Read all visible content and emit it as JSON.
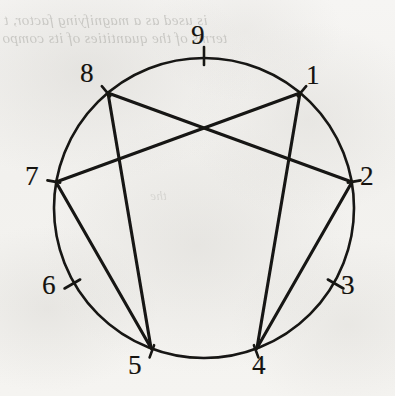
{
  "figure": {
    "kind": "circle-chord-diagram",
    "caption": "",
    "ink_color": "#171512",
    "paper_color": "#f4f3f1",
    "circle": {
      "cx": 204,
      "cy": 208,
      "r": 150
    },
    "nodes": [
      {
        "id": "1",
        "label": "1",
        "angle_deg": -50,
        "x": 300,
        "y": 93,
        "label_x": 306,
        "label_y": 62,
        "has_chords": true
      },
      {
        "id": "2",
        "label": "2",
        "angle_deg": -10,
        "x": 352,
        "y": 182,
        "label_x": 360,
        "label_y": 163,
        "has_chords": true
      },
      {
        "id": "3",
        "label": "3",
        "angle_deg": 30,
        "x": 334,
        "y": 283,
        "label_x": 341,
        "label_y": 272,
        "has_chords": false
      },
      {
        "id": "4",
        "label": "4",
        "angle_deg": 70,
        "x": 257,
        "y": 348,
        "label_x": 252,
        "label_y": 352,
        "has_chords": true
      },
      {
        "id": "5",
        "label": "5",
        "angle_deg": 110,
        "x": 151,
        "y": 348,
        "label_x": 128,
        "label_y": 352,
        "has_chords": true
      },
      {
        "id": "6",
        "label": "6",
        "angle_deg": 150,
        "x": 74,
        "y": 283,
        "label_x": 42,
        "label_y": 272,
        "has_chords": false
      },
      {
        "id": "7",
        "label": "7",
        "angle_deg": 190,
        "x": 56,
        "y": 182,
        "label_x": 25,
        "label_y": 163,
        "has_chords": true
      },
      {
        "id": "8",
        "label": "8",
        "angle_deg": 230,
        "x": 108,
        "y": 93,
        "label_x": 80,
        "label_y": 60,
        "has_chords": true
      },
      {
        "id": "9",
        "label": "9",
        "angle_deg": 270,
        "x": 204,
        "y": 58,
        "label_x": 191,
        "label_y": 22,
        "has_chords": false
      }
    ],
    "chords": [
      {
        "from": "8",
        "to": "2"
      },
      {
        "from": "1",
        "to": "7"
      },
      {
        "from": "1",
        "to": "4"
      },
      {
        "from": "2",
        "to": "4"
      },
      {
        "from": "8",
        "to": "5"
      },
      {
        "from": "7",
        "to": "5"
      }
    ],
    "showthrough_text": {
      "line1": "is used as a magnifying factor, t",
      "line2": "terms of the quantities of its compo",
      "line3": "the",
      "line4": ""
    }
  },
  "chart_data": {
    "type": "scatter",
    "title": "",
    "subtitle": "",
    "xlabel": "",
    "ylabel": "",
    "grid": false,
    "legend": null,
    "categories": [
      "1",
      "2",
      "3",
      "4",
      "5",
      "6",
      "7",
      "8",
      "9"
    ],
    "x": [
      300,
      352,
      334,
      257,
      151,
      74,
      56,
      108,
      204
    ],
    "y": [
      93,
      182,
      283,
      348,
      348,
      283,
      182,
      93,
      58
    ],
    "series": [
      {
        "name": "nodes",
        "values": [
          1,
          2,
          3,
          4,
          5,
          6,
          7,
          8,
          9
        ]
      }
    ],
    "edges": [
      [
        "8",
        "2"
      ],
      [
        "1",
        "7"
      ],
      [
        "1",
        "4"
      ],
      [
        "2",
        "4"
      ],
      [
        "8",
        "5"
      ],
      [
        "7",
        "5"
      ]
    ],
    "axis_ranges": {
      "xlim": [
        0,
        395
      ],
      "ylim": [
        396,
        0
      ]
    }
  }
}
